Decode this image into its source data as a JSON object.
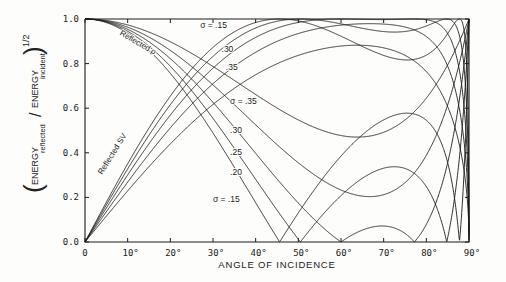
{
  "chart_data": {
    "type": "line",
    "title": "",
    "xlabel": "ANGLE OF INCIDENCE",
    "ylabel": "(ENERGY reflected / ENERGY incident)^1/2",
    "ylabel_parts": {
      "energy1": "ENERGY",
      "sub1": "reflected",
      "slash": "/",
      "energy2": "ENERGY",
      "sub2": "incident",
      "exponent": "1/2"
    },
    "xlim": [
      0,
      90
    ],
    "ylim": [
      0.0,
      1.0
    ],
    "x_ticks": [
      "0",
      "10°",
      "20°",
      "30°",
      "40°",
      "50°",
      "60°",
      "70°",
      "80°",
      "90°"
    ],
    "y_ticks": [
      "0.0",
      "0.2",
      "0.4",
      "0.6",
      "0.8",
      "1.0"
    ],
    "grid": false,
    "poisson_ratios": [
      0.15,
      0.2,
      0.25,
      0.3,
      0.35
    ],
    "series_groups": [
      {
        "name": "Reflected P",
        "label": "Reflected ρ",
        "description": "Amplitude of reflected P wave; starts at 1.0 at normal incidence, V-shaped zeros for low sigma",
        "approx_zero_angles_deg": {
          "0.15": 45.5,
          "0.20": 50,
          "0.25": 59.5,
          "0.30": 77,
          "0.35": null
        },
        "sigma_035_min": {
          "angle_deg": 63,
          "value": 0.48
        }
      },
      {
        "name": "Reflected SV",
        "label": "Reflected SV",
        "description": "Amplitude of reflected SV wave; starts at 0 at normal incidence, peaks then returns to 0 at 90°",
        "approx_peak": {
          "0.15": [
            45,
            0.99
          ],
          "0.35": [
            55,
            0.88
          ]
        }
      }
    ],
    "annotations": [
      {
        "text": "Reflected ρ",
        "x_deg": 8,
        "y": 0.93,
        "rotate": 30
      },
      {
        "text": "Reflected SV",
        "x_deg": 4,
        "y": 0.3,
        "rotate": -58
      },
      {
        "text": "σ = .15",
        "x_deg": 27,
        "y": 0.96
      },
      {
        "text": ".30",
        "x_deg": 32,
        "y": 0.85
      },
      {
        "text": ".35",
        "x_deg": 33,
        "y": 0.77
      },
      {
        "text": "σ = .35",
        "x_deg": 34,
        "y": 0.62
      },
      {
        "text": ".30",
        "x_deg": 34,
        "y": 0.49
      },
      {
        "text": ".25",
        "x_deg": 34,
        "y": 0.39
      },
      {
        "text": ".20",
        "x_deg": 34,
        "y": 0.3
      },
      {
        "text": "σ =  .15",
        "x_deg": 30,
        "y": 0.18
      }
    ]
  }
}
